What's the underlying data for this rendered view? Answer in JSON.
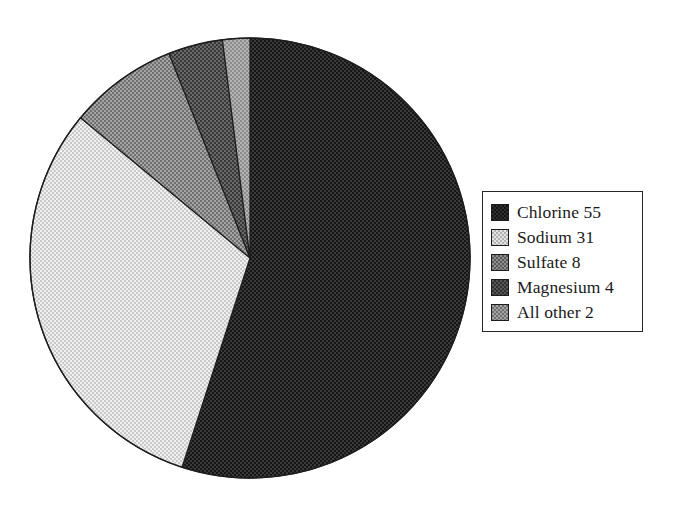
{
  "chart_data": {
    "type": "pie",
    "title": "",
    "subtitle": "",
    "xlabel": "",
    "ylabel": "",
    "grid": false,
    "legend_position": "right",
    "start_angle_deg": 0,
    "direction": "clockwise",
    "center": [
      250,
      258
    ],
    "radius": 220,
    "categories": [
      "Chlorine",
      "Sodium",
      "Sulfate",
      "Magnesium",
      "All other"
    ],
    "values": [
      55,
      31,
      8,
      4,
      2
    ],
    "units": "percent",
    "slices": [
      {
        "label": "Chlorine",
        "value": 55,
        "legend_text": "Chlorine 55",
        "color": "#2f2f2f",
        "start_deg": 0.0,
        "end_deg": 198.0
      },
      {
        "label": "Sodium",
        "value": 31,
        "legend_text": "Sodium 31",
        "color": "#e2e2e2",
        "start_deg": 198.0,
        "end_deg": 309.6
      },
      {
        "label": "Sulfate",
        "value": 8,
        "legend_text": "Sulfate 8",
        "color": "#8d8d8d",
        "start_deg": 309.6,
        "end_deg": 338.4
      },
      {
        "label": "Magnesium",
        "value": 4,
        "legend_text": "Magnesium 4",
        "color": "#565656",
        "start_deg": 338.4,
        "end_deg": 352.8
      },
      {
        "label": "All other",
        "value": 2,
        "legend_text": "All other 2",
        "color": "#a2a2a2",
        "start_deg": 352.8,
        "end_deg": 360.0
      }
    ]
  },
  "legend": {
    "items": [
      {
        "label": "Chlorine 55",
        "swatch": "chlorine-swatch"
      },
      {
        "label": "Sodium 31",
        "swatch": "sodium-swatch"
      },
      {
        "label": "Sulfate 8",
        "swatch": "sulfate-swatch"
      },
      {
        "label": "Magnesium 4",
        "swatch": "magnesium-swatch"
      },
      {
        "label": "All other 2",
        "swatch": "allother-swatch"
      }
    ]
  }
}
